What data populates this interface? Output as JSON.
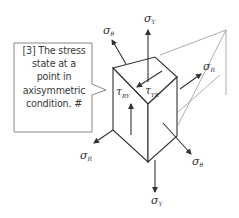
{
  "callout": {
    "lines": [
      "[3] The stress",
      "state at a",
      "point in",
      "axisymmetric",
      "condition.  #"
    ]
  },
  "labels": {
    "sigma_theta_top": {
      "sym": "σ",
      "sub": "θ"
    },
    "sigma_y_top": {
      "sym": "σ",
      "sub": "Y"
    },
    "sigma_r_right": {
      "sym": "σ",
      "sub": "R"
    },
    "tau_ry": {
      "sym": "τ",
      "sub": "RY"
    },
    "tau_yr": {
      "sym": "τ",
      "sub": "YR"
    },
    "sigma_r_left": {
      "sym": "σ",
      "sub": "R"
    },
    "sigma_theta_bottom": {
      "sym": "σ",
      "sub": "θ"
    },
    "sigma_y_bottom": {
      "sym": "σ",
      "sub": "Y"
    }
  },
  "colors": {
    "stroke": "#333333",
    "light_stroke": "#999999",
    "callout_border": "#888888",
    "text": "#3a3a3a"
  }
}
